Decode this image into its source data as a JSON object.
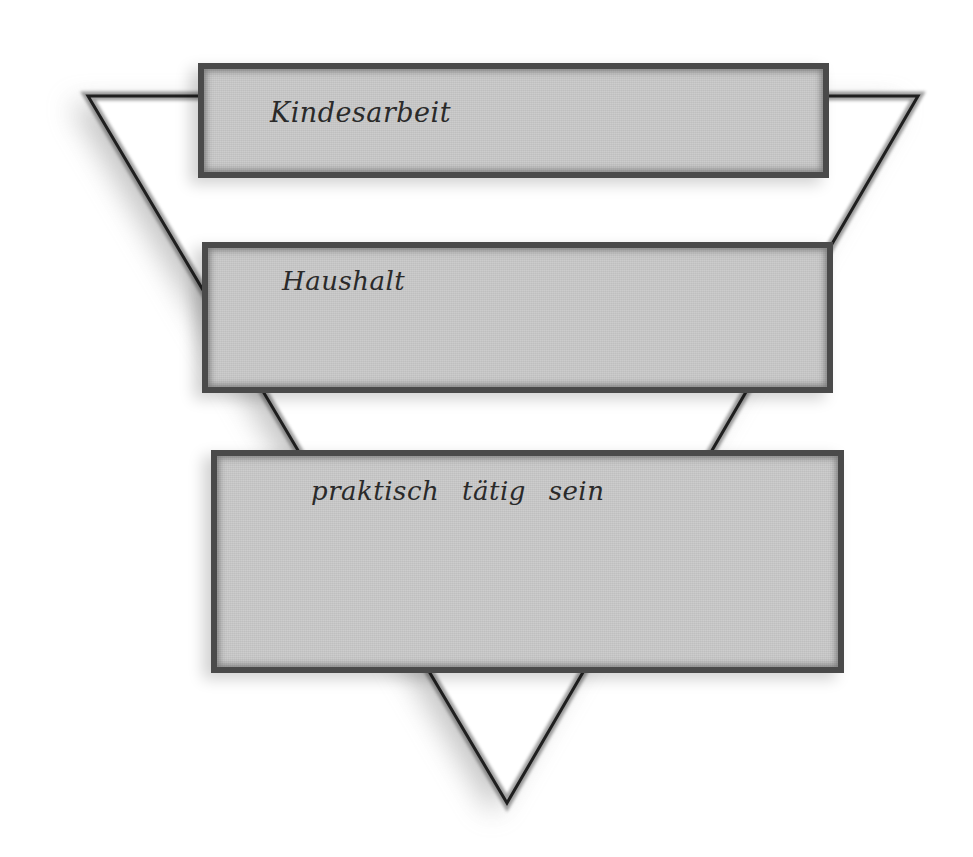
{
  "diagram": {
    "type": "inverted-triangle-with-layered-boxes",
    "triangle": {
      "orientation": "pointing-down",
      "vertices": {
        "top_left": [
          88,
          96
        ],
        "top_right": [
          918,
          96
        ],
        "apex": [
          507,
          803
        ]
      },
      "stroke_color": "#2b2b2b",
      "fill_color": "#ffffff"
    },
    "layers": [
      {
        "level": 1,
        "position": "top",
        "label": "Kindesarbeit",
        "box": {
          "x": 198,
          "y": 63,
          "width": 631,
          "height": 115
        }
      },
      {
        "level": 2,
        "position": "middle",
        "label": "Haushalt",
        "box": {
          "x": 202,
          "y": 242,
          "width": 631,
          "height": 151
        }
      },
      {
        "level": 3,
        "position": "bottom",
        "label": "praktisch tätig sein",
        "box": {
          "x": 211,
          "y": 450,
          "width": 633,
          "height": 223
        }
      }
    ],
    "colors": {
      "box_fill": "#c9c9c9",
      "box_border": "#4a4a4a",
      "text": "#2a2a2a",
      "background": "#ffffff",
      "shadow": "#bdbdbd"
    }
  }
}
